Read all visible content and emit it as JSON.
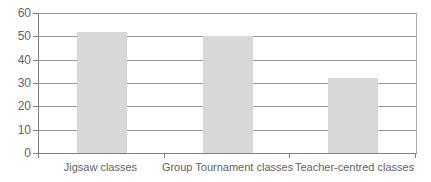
{
  "chart_data": {
    "type": "bar",
    "categories": [
      "Jigsaw classes",
      "Group Tournament classes",
      "Teacher-centred classes"
    ],
    "values": [
      52,
      50,
      32
    ],
    "yticks": [
      0,
      10,
      20,
      30,
      40,
      50,
      60
    ],
    "ylim": [
      0,
      60
    ],
    "ytick_step": 10,
    "xlabel": "",
    "ylabel": "",
    "title": "",
    "grid": "horizontal",
    "legend": "none",
    "colors": {
      "bar_fill": "#d8d8d8",
      "gridline": "#9a9a9a",
      "axis": "#808080",
      "plot_right_border": "#ababab",
      "text": "#636363",
      "background": "#ffffff"
    }
  }
}
